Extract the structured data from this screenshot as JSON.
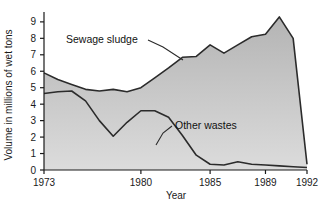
{
  "chart_data": {
    "type": "area",
    "title": "",
    "subtitle": "",
    "xlabel": "Year",
    "ylabel": "Volume in millions of wet tons",
    "xlim": [
      1973,
      1992
    ],
    "ylim": [
      0,
      9.6
    ],
    "grid": false,
    "legend_position": "inline-annotations",
    "x_tick_labels": [
      "1973",
      "1980",
      "1985",
      "1989",
      "1992"
    ],
    "x_ticks": [
      1973,
      1980,
      1985,
      1989,
      1992
    ],
    "y_tick_labels": [
      "0",
      "1",
      "2",
      "3",
      "4",
      "5",
      "6",
      "7",
      "8",
      "9"
    ],
    "y_ticks": [
      0,
      1,
      2,
      3,
      4,
      5,
      6,
      7,
      8,
      9
    ],
    "x": [
      1973,
      1974,
      1975,
      1976,
      1977,
      1978,
      1979,
      1980,
      1981,
      1982,
      1983,
      1984,
      1985,
      1986,
      1987,
      1988,
      1989,
      1990,
      1991,
      1992
    ],
    "series": [
      {
        "name": "Sewage sludge",
        "values": [
          5.9,
          5.5,
          5.2,
          4.9,
          4.8,
          4.9,
          4.75,
          5.0,
          5.6,
          6.2,
          6.85,
          6.9,
          7.6,
          7.1,
          7.6,
          8.1,
          8.25,
          9.3,
          8.0,
          0.35
        ]
      },
      {
        "name": "Other wastes",
        "values": [
          4.65,
          4.75,
          4.8,
          4.2,
          3.0,
          2.05,
          2.9,
          3.6,
          3.6,
          3.2,
          2.1,
          0.9,
          0.35,
          0.3,
          0.5,
          0.35,
          0.3,
          0.25,
          0.2,
          0.15
        ]
      }
    ],
    "annotations": [
      {
        "text": "Sewage sludge",
        "label_x": 66,
        "label_y": 43,
        "leader": [
          [
            148,
            40
          ],
          [
            163,
            47
          ],
          [
            183,
            60
          ]
        ]
      },
      {
        "text": "Other wastes",
        "label_x": 175,
        "label_y": 129,
        "leader": [
          [
            172,
            126
          ],
          [
            163,
            133
          ],
          [
            156,
            145
          ]
        ]
      }
    ],
    "colors": {
      "area_fill_top": "#b6b6b6",
      "area_fill_bottom": "#d8d8d8",
      "line": "#2b2b2b",
      "axis": "#1a1a1a",
      "background": "#ffffff"
    }
  }
}
